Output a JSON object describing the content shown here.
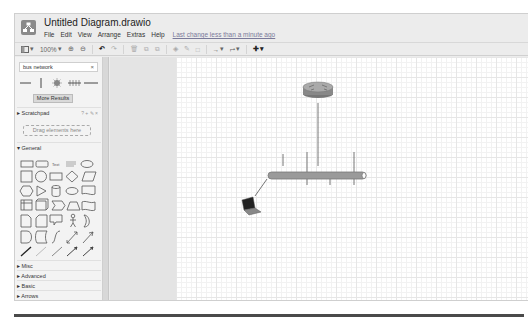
{
  "app": {
    "doc_title": "Untitled Diagram.drawio",
    "menu": [
      "File",
      "Edit",
      "View",
      "Arrange",
      "Extras",
      "Help"
    ],
    "last_change": "Last change less than a minute ago"
  },
  "toolbar": {
    "format_panel_icon": "panel-toggle-icon",
    "zoom_level": "100%",
    "items": [
      "zoom-in",
      "zoom-out",
      "undo",
      "redo",
      "delete",
      "to-front",
      "to-back",
      "fill-color",
      "line-color",
      "shadow",
      "connection",
      "waypoints",
      "insert"
    ]
  },
  "sidebar": {
    "search": {
      "value": "bus network",
      "clear": "×"
    },
    "more_results": "More Results",
    "scratchpad": {
      "label": "Scratchpad",
      "tools": "? + ✎ ×",
      "drop_hint": "Drag elements here"
    },
    "sections": [
      "General",
      "Misc",
      "Advanced",
      "Basic",
      "Arrows"
    ],
    "expanded_section": "General"
  },
  "diagram": {
    "nodes": [
      {
        "type": "router",
        "label": ""
      },
      {
        "type": "bus-cable",
        "label": ""
      },
      {
        "type": "laptop",
        "label": ""
      }
    ],
    "bus_taps_above": 4,
    "bus_taps_below": 3
  },
  "colors": {
    "bus_fill": "#9a9a9a",
    "bus_stroke": "#777777",
    "chrome": "#ececec",
    "canvas": "#ffffff"
  }
}
